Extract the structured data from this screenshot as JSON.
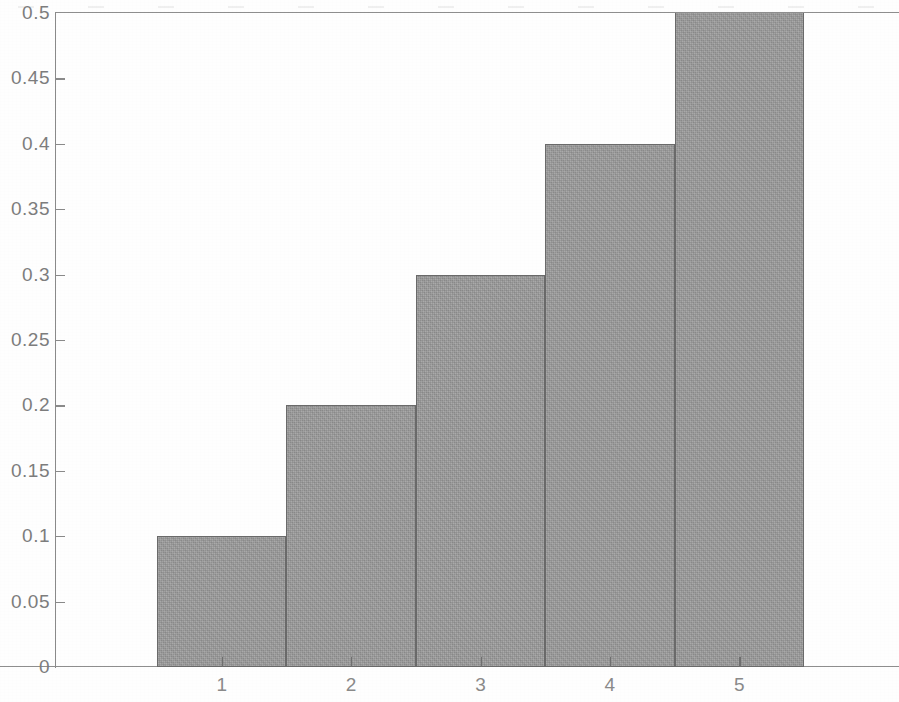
{
  "chart_data": {
    "type": "bar",
    "title": "",
    "subtitle": "",
    "xlabel": "",
    "ylabel": "",
    "categories": [
      "1",
      "2",
      "3",
      "4",
      "5"
    ],
    "values": [
      0.1,
      0.2,
      0.3,
      0.4,
      0.5
    ],
    "series": [
      {
        "name": "",
        "values": [
          0.1,
          0.2,
          0.3,
          0.4,
          0.5
        ]
      }
    ],
    "ylim": [
      0,
      0.5
    ],
    "xlim": [
      0.5,
      5.5
    ],
    "y_ticks": [
      0,
      0.05,
      0.1,
      0.15,
      0.2,
      0.25,
      0.3,
      0.35,
      0.4,
      0.45,
      0.5
    ],
    "y_tick_labels": [
      "0",
      "0.05",
      "0.1",
      "0.15",
      "0.2",
      "0.25",
      "0.3",
      "0.35",
      "0.4",
      "0.45",
      "0.5"
    ],
    "x_ticks": [
      1,
      2,
      3,
      4,
      5
    ],
    "x_tick_labels": [
      "1",
      "2",
      "3",
      "4",
      "5"
    ],
    "grid": false,
    "legend": null,
    "legend_position": "none",
    "bar_fill_color": "#9c9c9c",
    "bar_edge_color": "#6a6a6a",
    "axis_color": "#8a8a8a",
    "tick_label_color": "#8a8a8a",
    "background_color": "#ffffff",
    "annotations": []
  },
  "axis": {
    "y_labels": [
      {
        "text": "0.5",
        "value": 0.5
      },
      {
        "text": "0.45",
        "value": 0.45
      },
      {
        "text": "0.4",
        "value": 0.4
      },
      {
        "text": "0.35",
        "value": 0.35
      },
      {
        "text": "0.3",
        "value": 0.3
      },
      {
        "text": "0.25",
        "value": 0.25
      },
      {
        "text": "0.2",
        "value": 0.2
      },
      {
        "text": "0.15",
        "value": 0.15
      },
      {
        "text": "0.1",
        "value": 0.1
      },
      {
        "text": "0.05",
        "value": 0.05
      },
      {
        "text": "0",
        "value": 0
      }
    ],
    "x_labels": [
      {
        "text": "1",
        "value": 1
      },
      {
        "text": "2",
        "value": 2
      },
      {
        "text": "3",
        "value": 3
      },
      {
        "text": "4",
        "value": 4
      },
      {
        "text": "5",
        "value": 5
      }
    ]
  },
  "bars": [
    {
      "category": "1",
      "value": 0.1
    },
    {
      "category": "2",
      "value": 0.2
    },
    {
      "category": "3",
      "value": 0.3
    },
    {
      "category": "4",
      "value": 0.4
    },
    {
      "category": "5",
      "value": 0.5
    }
  ]
}
